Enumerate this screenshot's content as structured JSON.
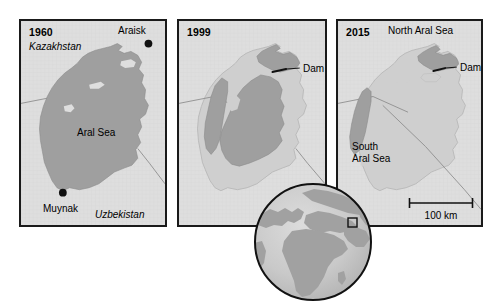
{
  "figure": {
    "type": "map-series"
  },
  "panels": [
    {
      "year": "1960",
      "labels": [
        {
          "name": "country-label-kazakhstan",
          "text": "Kazakhstan",
          "style": "italic",
          "x": 8,
          "y": 22
        },
        {
          "name": "city-label-araisk",
          "text": "Araisk",
          "style": "normal",
          "x": 97,
          "y": 5
        },
        {
          "name": "sea-label-aral-sea",
          "text": "Aral Sea",
          "style": "normal",
          "x": 56,
          "y": 112
        },
        {
          "name": "city-label-muynak",
          "text": "Muynak",
          "style": "normal",
          "x": 24,
          "y": 183
        },
        {
          "name": "country-label-uzbekistan",
          "text": "Uzbekistan",
          "style": "italic",
          "x": 75,
          "y": 190
        }
      ],
      "cities": [
        {
          "name": "city-dot-araisk",
          "label": "Araisk",
          "x": 131,
          "y": 23
        },
        {
          "name": "city-dot-muynak",
          "label": "Muynak",
          "x": 43,
          "y": 175
        }
      ]
    },
    {
      "year": "1999",
      "labels": [
        {
          "name": "feature-label-dam",
          "text": "Dam",
          "style": "normal",
          "x": 114,
          "y": 51
        }
      ],
      "cities": []
    },
    {
      "year": "2015",
      "labels": [
        {
          "name": "sea-label-north-aral-sea",
          "text": "North Aral Sea",
          "style": "normal",
          "x": 50,
          "y": 5
        },
        {
          "name": "feature-label-dam",
          "text": "Dam",
          "style": "normal",
          "x": 113,
          "y": 50
        },
        {
          "name": "sea-label-south-1",
          "text": "South",
          "style": "normal",
          "x": 14,
          "y": 124
        },
        {
          "name": "sea-label-south-2",
          "text": "Aral Sea",
          "style": "normal",
          "x": 14,
          "y": 136
        }
      ],
      "cities": []
    }
  ],
  "scale_bar": {
    "label": "100 km",
    "length_px": 66
  },
  "globe_inset": {
    "name": "globe-locator-inset",
    "marker": "location-box-marker",
    "description": "Globe showing Europe, Africa and Asia with a small square marking the Aral Sea region"
  },
  "colors": {
    "land": "#dedede",
    "water_1960": "#9f9f9f",
    "water_1999": "#9f9f9f",
    "former_seabed": "#cfcfcf",
    "border_line": "#8a8a8a",
    "panel_border": "#1a1a1a",
    "globe_ocean": "#c8c8c8",
    "globe_land": "#9f9f9f",
    "text": "#000000"
  }
}
